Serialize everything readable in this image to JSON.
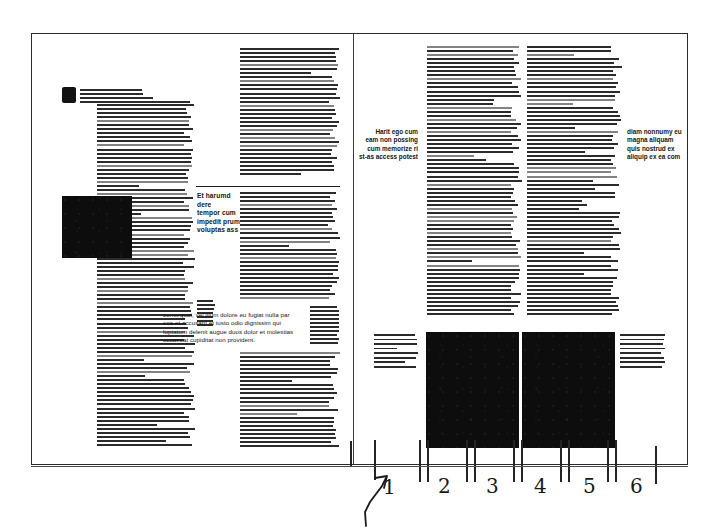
{
  "document": {
    "kind": "scanned-magazine-spread-layout-markup",
    "page_count_visible": 2,
    "background_color": "#ffffff",
    "ink_color": "#1b1b1b",
    "frame_color": "#2b2b2b"
  },
  "left_page": {
    "dropcap_letter": "E",
    "lead_text": "eligured cupiditas, quos nulla prod erase prassant ku molestias excepteur sint occaecat cup sunt in culpa qui officia deserunt molli. Et harumd dereud facilis est er expedi soluta nobis eligent optio est congue",
    "columns": [
      {
        "id": "left-col-1",
        "greek_lines": 58,
        "x": 97,
        "y": 92,
        "width": 98
      },
      {
        "id": "left-col-2",
        "greek_lines": 58,
        "x": 240,
        "y": 48,
        "width": 100
      }
    ],
    "image_plate": {
      "id": "left-photo-plate",
      "x": 62,
      "y": 196,
      "width": 70,
      "height": 62,
      "fill": "#0d0d0d"
    },
    "pull_quote": {
      "text": "Et harumd dere tempor cum impedit prum voluptas ass",
      "lines": [
        "Et harumd dere",
        "tempor cum",
        "impedit prum",
        "voluptas ass"
      ],
      "align": "left"
    },
    "callout_paragraph": {
      "lines": [
        "consequat, vel illum dolore eu fugiat nulla par",
        "eos et accusam et iusto odio dignissim qui",
        "luptatum delenit augue duos dolor et molestias",
        "occaecat cupiditat non provident."
      ]
    }
  },
  "right_page": {
    "margin_note_left": {
      "lines": [
        "Harit ego cum",
        "eam non possing",
        "cum memorize ri",
        "st-as access potest"
      ],
      "align": "right"
    },
    "margin_note_right": {
      "lines": [
        "diam nonnumy eu",
        "magna aliquam",
        "quis nostrud ex",
        "aliquip ex ea com"
      ],
      "align": "left"
    },
    "columns": [
      {
        "id": "right-col-1",
        "greek_lines": 66,
        "x": 427,
        "y": 46,
        "width": 95
      },
      {
        "id": "right-col-2",
        "greek_lines": 66,
        "x": 527,
        "y": 46,
        "width": 95
      }
    ],
    "caption_left": {
      "lines_count": 8,
      "text": "Harumd magn sint optatum adipisicing efficant pariatr duis Magni consectetur et Erebunt cumpt avam hebeco prodim a fugi-a smolt dissollitatdes. Ci velitationam denum"
    },
    "caption_right": {
      "lines_count": 8,
      "text": "Magam dolorem ng ut a primis debias repellen dicit suscipit is primis et nemo a ratonibus voluptatem sap temo provident qui bustis lu quouts ames nit nisi est aspernatus ust facilitier nequa perio cupiditior quam nulla"
    },
    "image_plates": [
      {
        "id": "right-photo-plate-1",
        "x": 426,
        "y": 332,
        "width": 93,
        "height": 116,
        "fill": "#0d0d0d"
      },
      {
        "id": "right-photo-plate-2",
        "x": 522,
        "y": 332,
        "width": 93,
        "height": 116,
        "fill": "#0d0d0d"
      }
    ]
  },
  "annotations": {
    "description": "handwritten pencil column-grid markup below the spread",
    "baseline_y": 466,
    "arrow": {
      "label": "arrow-to-page-edge",
      "x": 362,
      "y": 470
    },
    "column_numbers": [
      "1",
      "2",
      "3",
      "4",
      "5",
      "6"
    ],
    "number_positions_x": [
      382,
      441,
      489,
      539,
      587,
      634
    ],
    "tick_positions_x": [
      350,
      375,
      420,
      428,
      466,
      474,
      513,
      521,
      560,
      568,
      608,
      616,
      656
    ],
    "ink_color": "#191919"
  }
}
